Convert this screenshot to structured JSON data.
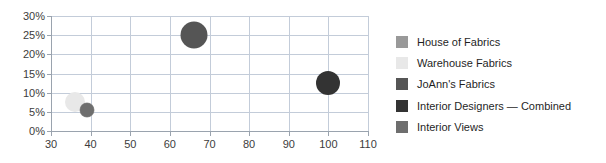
{
  "chart_data": {
    "type": "scatter",
    "title": "",
    "subtitle": "",
    "xlabel": "",
    "ylabel": "",
    "xlim": [
      30,
      110
    ],
    "ylim": [
      0,
      0.3
    ],
    "grid": true,
    "legend_position": "right",
    "x_ticks": [
      "30",
      "40",
      "50",
      "60",
      "70",
      "80",
      "90",
      "100",
      "110"
    ],
    "x_tick_values": [
      30,
      40,
      50,
      60,
      70,
      80,
      90,
      100,
      110
    ],
    "y_ticks": [
      "0%",
      "5%",
      "10%",
      "15%",
      "20%",
      "25%",
      "30%"
    ],
    "y_tick_values": [
      0,
      5,
      10,
      15,
      20,
      25,
      30
    ],
    "series": [
      {
        "name": "House of Fabrics",
        "color": "#999999",
        "x": 39,
        "y": 5.5,
        "size": 15
      },
      {
        "name": "Warehouse Fabrics",
        "color": "#e8e8e8",
        "x": 36,
        "y": 7.5,
        "size": 20
      },
      {
        "name": "JoAnn's Fabrics",
        "color": "#555555",
        "x": 66,
        "y": 25,
        "size": 27
      },
      {
        "name": "Interior Designers — Combined",
        "color": "#333333",
        "x": 100,
        "y": 12.5,
        "size": 24
      },
      {
        "name": "Interior Views",
        "color": "#6e6e6e",
        "x": 39,
        "y": 5.5,
        "size": 14
      }
    ]
  },
  "legend": {
    "items": [
      {
        "label": "House of Fabrics",
        "color": "#999999"
      },
      {
        "label": "Warehouse Fabrics",
        "color": "#e8e8e8"
      },
      {
        "label": "JoAnn's Fabrics",
        "color": "#555555"
      },
      {
        "label": "Interior Designers — Combined",
        "color": "#333333"
      },
      {
        "label": "Interior Views",
        "color": "#6e6e6e"
      }
    ]
  },
  "style": {
    "gridline_color": "#c3ccd9",
    "axis_color": "#9aa3ae",
    "background": "#ffffff",
    "tick_label_color": "#3c3c3c",
    "legend_text_color": "#1f1f1f"
  }
}
